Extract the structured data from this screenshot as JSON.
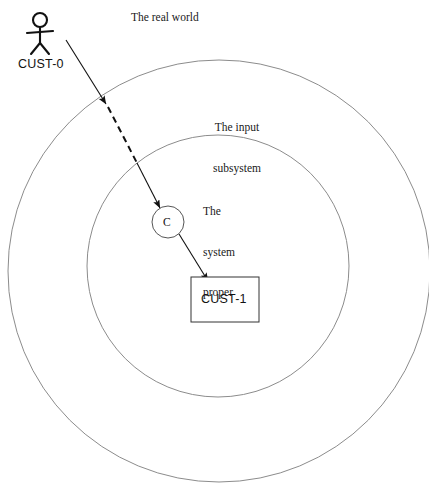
{
  "diagram": {
    "title_labels": {
      "real_world": "The real world",
      "input_subsystem_line1": "The input",
      "input_subsystem_line2": "subsystem",
      "system_proper_line1": "The",
      "system_proper_line2": "system",
      "system_proper_line3": "proper"
    },
    "nodes": {
      "actor_label": "CUST-0",
      "process_label": "C",
      "entity_label": "CUST-1"
    },
    "colors": {
      "stroke": "#111111",
      "boundary_stroke": "#8c8c8c",
      "background": "#ffffff",
      "text": "#1a1a1a"
    },
    "geometry": {
      "outer_boundary": {
        "cx": 219,
        "cy": 271,
        "r": 211
      },
      "inner_boundary": {
        "cx": 218,
        "cy": 266,
        "r": 131
      },
      "process_circle": {
        "cx": 168,
        "cy": 222,
        "r": 16
      },
      "entity_box": {
        "x": 191,
        "y": 277,
        "w": 68,
        "h": 45
      },
      "actor": {
        "head_cx": 40,
        "head_cy": 20,
        "head_r": 7
      }
    }
  }
}
